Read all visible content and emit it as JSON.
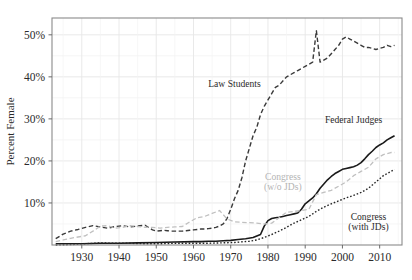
{
  "chart_data": {
    "type": "line",
    "title": "",
    "subtitle": "",
    "xlabel": "",
    "ylabel": "Percent Female",
    "xlim": [
      1922,
      2016
    ],
    "ylim": [
      0,
      54
    ],
    "grid": true,
    "legend_position": "inline-annotations",
    "ytick_labels": [
      "10%",
      "20%",
      "30%",
      "40%",
      "50%"
    ],
    "ytick_values": [
      10,
      20,
      30,
      40,
      50
    ],
    "ytick_minor_values": [
      5,
      15,
      25,
      35,
      45
    ],
    "xtick_labels": [
      "1930",
      "1940",
      "1950",
      "1960",
      "1970",
      "1980",
      "1990",
      "2000",
      "2010"
    ],
    "xtick_values": [
      1930,
      1940,
      1950,
      1960,
      1970,
      1980,
      1990,
      2000,
      2010
    ],
    "series": [
      {
        "name": "Law Students",
        "label": "Law Students",
        "label_x": 1971,
        "label_y": 37.5,
        "color": "#3a3a3a",
        "style": "dashed",
        "width": 1.4,
        "x": [
          1923,
          1925,
          1927,
          1929,
          1931,
          1933,
          1935,
          1937,
          1939,
          1941,
          1943,
          1945,
          1947,
          1949,
          1950,
          1951,
          1952,
          1953,
          1954,
          1955,
          1956,
          1957,
          1958,
          1959,
          1960,
          1961,
          1962,
          1963,
          1964,
          1965,
          1966,
          1967,
          1968,
          1969,
          1970,
          1971,
          1972,
          1973,
          1974,
          1975,
          1976,
          1977,
          1978,
          1979,
          1980,
          1981,
          1982,
          1983,
          1984,
          1985,
          1986,
          1987,
          1988,
          1989,
          1990,
          1991,
          1992,
          1993,
          1994,
          1995,
          1996,
          1997,
          1998,
          1999,
          2000,
          2001,
          2002,
          2003,
          2004,
          2005,
          2006,
          2007,
          2008,
          2009,
          2010,
          2011,
          2012,
          2013,
          2014
        ],
        "y": [
          1.5,
          2.6,
          3.3,
          3.7,
          4.2,
          4.6,
          4.3,
          4.0,
          4.4,
          4.6,
          4.3,
          4.5,
          4.7,
          3.6,
          3.3,
          3.4,
          3.5,
          3.4,
          3.3,
          3.3,
          3.3,
          3.3,
          3.4,
          3.5,
          3.6,
          3.7,
          3.8,
          3.8,
          3.9,
          4.0,
          4.2,
          4.5,
          5.0,
          6.3,
          8.5,
          11.0,
          13.0,
          16.0,
          20.0,
          23.0,
          26.0,
          28.0,
          31.0,
          33.0,
          34.5,
          36.0,
          37.5,
          38.0,
          39.0,
          40.0,
          40.5,
          41.0,
          41.5,
          42.0,
          42.5,
          43.0,
          43.5,
          51.0,
          43.5,
          44.0,
          44.5,
          45.5,
          46.5,
          47.5,
          49.0,
          49.5,
          49.0,
          48.5,
          48.0,
          47.5,
          47.0,
          47.0,
          46.8,
          46.5,
          46.8,
          47.0,
          47.5,
          47.2,
          47.5
        ]
      },
      {
        "name": "Federal Judges",
        "label": "Federal Judges",
        "label_x": 2003,
        "label_y": 29.0,
        "color": "#1a1a1a",
        "style": "solid",
        "width": 1.6,
        "x": [
          1923,
          1930,
          1935,
          1940,
          1945,
          1950,
          1955,
          1960,
          1962,
          1964,
          1966,
          1968,
          1970,
          1972,
          1974,
          1976,
          1978,
          1979,
          1980,
          1981,
          1982,
          1983,
          1984,
          1985,
          1986,
          1987,
          1988,
          1989,
          1990,
          1991,
          1992,
          1993,
          1994,
          1995,
          1996,
          1997,
          1998,
          1999,
          2000,
          2001,
          2002,
          2003,
          2004,
          2005,
          2006,
          2007,
          2008,
          2009,
          2010,
          2011,
          2012,
          2013,
          2014
        ],
        "y": [
          0.3,
          0.3,
          0.4,
          0.4,
          0.5,
          0.6,
          0.7,
          0.8,
          0.8,
          0.9,
          0.9,
          1.0,
          1.1,
          1.3,
          1.5,
          1.8,
          2.5,
          4.5,
          5.8,
          6.3,
          6.5,
          6.6,
          6.8,
          7.0,
          7.2,
          7.4,
          7.6,
          8.5,
          9.8,
          10.5,
          11.2,
          12.2,
          13.5,
          14.5,
          15.5,
          16.3,
          17.0,
          17.5,
          18.0,
          18.2,
          18.4,
          18.6,
          19.0,
          19.6,
          20.5,
          21.5,
          22.3,
          23.2,
          23.8,
          24.3,
          25.0,
          25.5,
          26.0
        ]
      },
      {
        "name": "Congress (w/o JDs)",
        "label": "Congress\n(w/o JDs)",
        "label_x": 1984,
        "label_y": 15.5,
        "color": "#c0c0c0",
        "style": "dashed",
        "width": 1.3,
        "x": [
          1923,
          1925,
          1927,
          1929,
          1931,
          1933,
          1935,
          1937,
          1939,
          1941,
          1943,
          1945,
          1947,
          1949,
          1951,
          1953,
          1955,
          1957,
          1959,
          1961,
          1963,
          1965,
          1967,
          1969,
          1971,
          1973,
          1975,
          1977,
          1979,
          1981,
          1983,
          1985,
          1987,
          1989,
          1991,
          1993,
          1995,
          1997,
          1999,
          2001,
          2003,
          2005,
          2007,
          2009,
          2011,
          2013,
          2014
        ],
        "y": [
          0.8,
          1.2,
          1.6,
          1.9,
          2.2,
          3.3,
          4.5,
          4.6,
          4.0,
          4.2,
          4.6,
          4.4,
          4.2,
          4.2,
          4.0,
          4.2,
          4.3,
          4.4,
          5.5,
          6.5,
          6.8,
          7.5,
          8.2,
          6.2,
          5.5,
          5.4,
          5.3,
          5.2,
          5.0,
          5.2,
          6.5,
          7.8,
          8.0,
          8.2,
          8.5,
          12.0,
          12.5,
          13.0,
          14.0,
          15.0,
          16.5,
          17.5,
          18.5,
          20.5,
          21.5,
          22.0,
          22.0
        ]
      },
      {
        "name": "Congress (with JDs)",
        "label": "Congress\n(with JDs)",
        "label_x": 2007,
        "label_y": 6.0,
        "color": "#252525",
        "style": "dotted",
        "width": 1.4,
        "x": [
          1923,
          1927,
          1931,
          1935,
          1939,
          1943,
          1947,
          1951,
          1955,
          1959,
          1963,
          1967,
          1971,
          1975,
          1977,
          1979,
          1981,
          1983,
          1985,
          1987,
          1989,
          1991,
          1993,
          1995,
          1997,
          1999,
          2001,
          2003,
          2005,
          2007,
          2009,
          2011,
          2013,
          2014
        ],
        "y": [
          0.0,
          0.1,
          0.3,
          0.5,
          0.4,
          0.4,
          0.3,
          0.3,
          0.4,
          0.4,
          0.4,
          0.5,
          0.6,
          0.9,
          1.2,
          1.8,
          2.5,
          3.3,
          4.2,
          5.2,
          6.0,
          6.8,
          8.0,
          9.0,
          9.8,
          10.5,
          11.2,
          11.8,
          12.5,
          13.5,
          15.0,
          16.5,
          17.5,
          18.0
        ]
      }
    ]
  }
}
